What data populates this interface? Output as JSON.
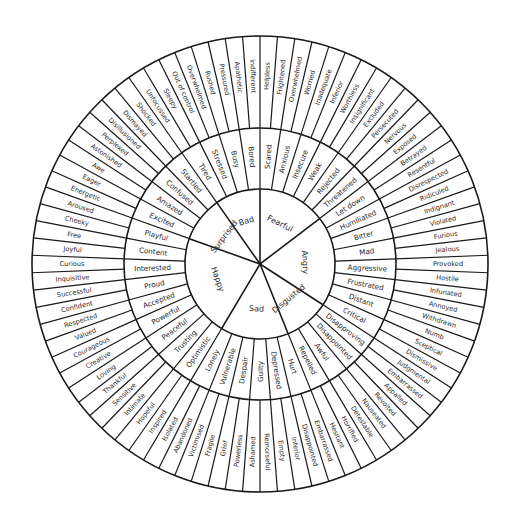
{
  "diagram": {
    "center": [
      260,
      264
    ],
    "radii": {
      "core": 75,
      "middle": 136,
      "outer": 228
    },
    "stroke_color": "#1a1a1a",
    "text_color": "#2a2a2a",
    "background": "#ffffff"
  },
  "core_emotions": [
    {
      "label": "Bad",
      "middle": [
        {
          "label": "Bored",
          "outer": [
            "Indifferent",
            "Apathetic"
          ]
        },
        {
          "label": "Busy",
          "outer": [
            "Pressured",
            "Rushed"
          ]
        },
        {
          "label": "Stressed",
          "outer": [
            "Overwhelmed",
            "Out of control"
          ]
        },
        {
          "label": "Tired",
          "outer": [
            "Sleepy",
            "Unfocussed"
          ]
        }
      ]
    },
    {
      "label": "Surprised",
      "middle": [
        {
          "label": "Startled",
          "outer": [
            "Shocked",
            "Dismayed"
          ]
        },
        {
          "label": "Confused",
          "outer": [
            "Disillusioned",
            "Perplexed"
          ]
        },
        {
          "label": "Amazed",
          "outer": [
            "Astonished",
            "Awe"
          ]
        },
        {
          "label": "Excited",
          "outer": [
            "Eager",
            "Energetic"
          ]
        }
      ]
    },
    {
      "label": "Happy",
      "middle": [
        {
          "label": "Playful",
          "outer": [
            "Aroused",
            "Cheeky"
          ]
        },
        {
          "label": "Content",
          "outer": [
            "Free",
            "Joyful"
          ]
        },
        {
          "label": "Interested",
          "outer": [
            "Curious",
            "Inquisitive"
          ]
        },
        {
          "label": "Proud",
          "outer": [
            "Successful",
            "Confident"
          ]
        },
        {
          "label": "Accepted",
          "outer": [
            "Respected",
            "Valued"
          ]
        },
        {
          "label": "Powerful",
          "outer": [
            "Courageous",
            "Creative"
          ]
        },
        {
          "label": "Peaceful",
          "outer": [
            "Loving",
            "Thankful"
          ]
        },
        {
          "label": "Trusting",
          "outer": [
            "Sensitive",
            "Intimate"
          ]
        },
        {
          "label": "Optimistic",
          "outer": [
            "Hopeful",
            "Inspired"
          ]
        }
      ]
    },
    {
      "label": "Sad",
      "middle": [
        {
          "label": "Lonely",
          "outer": [
            "Isolated",
            "Abandoned"
          ]
        },
        {
          "label": "Vulnerable",
          "outer": [
            "Victimised",
            "Fragile"
          ]
        },
        {
          "label": "Despair",
          "outer": [
            "Grief",
            "Powerless"
          ]
        },
        {
          "label": "Guilty",
          "outer": [
            "Ashamed",
            "Remorseful"
          ]
        },
        {
          "label": "Depressed",
          "outer": [
            "Empty",
            "Inferior"
          ]
        },
        {
          "label": "Hurt",
          "outer": [
            "Disappointed",
            "Embarrassed"
          ]
        }
      ]
    },
    {
      "label": "Disgusted",
      "middle": [
        {
          "label": "Repelled",
          "outer": [
            "Hesitant",
            "Horrified"
          ]
        },
        {
          "label": "Awful",
          "outer": [
            "Detestable",
            "Nauseated"
          ]
        },
        {
          "label": "Disappointed",
          "outer": [
            "Revolted",
            "Appalled"
          ]
        },
        {
          "label": "Disapproving",
          "outer": [
            "Embarrassed",
            "Judgmental"
          ]
        }
      ]
    },
    {
      "label": "Angry",
      "middle": [
        {
          "label": "Critical",
          "outer": [
            "Dismissive",
            "Sceptical"
          ]
        },
        {
          "label": "Distant",
          "outer": [
            "Numb",
            "Withdrawn"
          ]
        },
        {
          "label": "Frustrated",
          "outer": [
            "Annoyed",
            "Infuriated"
          ]
        },
        {
          "label": "Aggressive",
          "outer": [
            "Hostile",
            "Provoked"
          ]
        },
        {
          "label": "Mad",
          "outer": [
            "Jealous",
            "Furious"
          ]
        },
        {
          "label": "Bitter",
          "outer": [
            "Violated",
            "Indignant"
          ]
        },
        {
          "label": "Humiliated",
          "outer": [
            "Ridiculed",
            "Disrespected"
          ]
        },
        {
          "label": "Let down",
          "outer": [
            "Resentful",
            "Betrayed"
          ]
        }
      ]
    },
    {
      "label": "Fearful",
      "middle": [
        {
          "label": "Threatened",
          "outer": [
            "Exposed",
            "Nervous"
          ]
        },
        {
          "label": "Rejected",
          "outer": [
            "Persecuted",
            "Excluded"
          ]
        },
        {
          "label": "Weak",
          "outer": [
            "Insignificant",
            "Worthless"
          ]
        },
        {
          "label": "Insecure",
          "outer": [
            "Inferior",
            "Inadequate"
          ]
        },
        {
          "label": "Anxious",
          "outer": [
            "Worried",
            "Overwhelmed"
          ]
        },
        {
          "label": "Scared",
          "outer": [
            "Frightened",
            "Helpless"
          ]
        }
      ]
    }
  ]
}
